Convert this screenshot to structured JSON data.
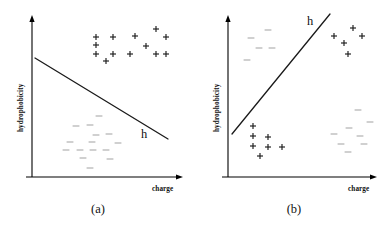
{
  "figure": {
    "width": 392,
    "height": 232,
    "background": "#ffffff",
    "marker_colors": {
      "positive": "#1c1c1c",
      "negative": "#b9b9b9",
      "axis": "#000000",
      "hypothesis_line": "#1a1a1a"
    }
  },
  "chart_data": {
    "type": "scatter",
    "title": "",
    "panels": [
      {
        "id": "a",
        "caption": "(a)",
        "xlabel": "charge",
        "ylabel": "hydrophobicity",
        "xlabel_pos": {
          "x": 152,
          "y": 186
        },
        "ylabel_pos": {
          "x": 18,
          "y": 132
        },
        "axes": {
          "origin": {
            "x": 32,
            "y": 177
          },
          "x_end": {
            "x": 183,
            "y": 177
          },
          "y_end": {
            "x": 32,
            "y": 15
          },
          "grid": false
        },
        "hypothesis": {
          "label": "h",
          "label_pos": {
            "x": 141,
            "y": 128
          },
          "x1": 35,
          "y1": 58,
          "x2": 168,
          "y2": 139
        },
        "legend": "",
        "series": [
          {
            "name": "positive",
            "symbol": "+",
            "points": [
              {
                "x": 96,
                "y": 37
              },
              {
                "x": 113,
                "y": 37
              },
              {
                "x": 135,
                "y": 36
              },
              {
                "x": 156,
                "y": 29
              },
              {
                "x": 166,
                "y": 37
              },
              {
                "x": 96,
                "y": 45
              },
              {
                "x": 146,
                "y": 46
              },
              {
                "x": 96,
                "y": 54
              },
              {
                "x": 113,
                "y": 54
              },
              {
                "x": 130,
                "y": 54
              },
              {
                "x": 156,
                "y": 54
              },
              {
                "x": 166,
                "y": 54
              },
              {
                "x": 106,
                "y": 61
              }
            ]
          },
          {
            "name": "negative",
            "symbol": "-",
            "points": [
              {
                "x": 99,
                "y": 116
              },
              {
                "x": 76,
                "y": 126
              },
              {
                "x": 90,
                "y": 125
              },
              {
                "x": 96,
                "y": 135
              },
              {
                "x": 109,
                "y": 134
              },
              {
                "x": 70,
                "y": 142
              },
              {
                "x": 92,
                "y": 142
              },
              {
                "x": 118,
                "y": 143
              },
              {
                "x": 66,
                "y": 150
              },
              {
                "x": 80,
                "y": 150
              },
              {
                "x": 93,
                "y": 150
              },
              {
                "x": 106,
                "y": 150
              },
              {
                "x": 83,
                "y": 158
              },
              {
                "x": 110,
                "y": 159
              },
              {
                "x": 90,
                "y": 168
              }
            ]
          }
        ]
      },
      {
        "id": "b",
        "caption": "(b)",
        "xlabel": "charge",
        "ylabel": "hydrophobicity",
        "xlabel_pos": {
          "x": 348,
          "y": 186
        },
        "ylabel_pos": {
          "x": 214,
          "y": 132
        },
        "axes": {
          "origin": {
            "x": 228,
            "y": 177
          },
          "x_end": {
            "x": 377,
            "y": 177
          },
          "y_end": {
            "x": 228,
            "y": 15
          },
          "grid": false
        },
        "hypothesis": {
          "label": "h",
          "label_pos": {
            "x": 307,
            "y": 15
          },
          "x1": 232,
          "y1": 134,
          "x2": 330,
          "y2": 14
        },
        "legend": "",
        "series": [
          {
            "name": "negative",
            "symbol": "-",
            "points": [
              {
                "x": 268,
                "y": 30
              },
              {
                "x": 251,
                "y": 38
              },
              {
                "x": 259,
                "y": 48
              },
              {
                "x": 272,
                "y": 48
              },
              {
                "x": 247,
                "y": 60
              },
              {
                "x": 358,
                "y": 110
              },
              {
                "x": 370,
                "y": 122
              },
              {
                "x": 349,
                "y": 128
              },
              {
                "x": 334,
                "y": 134
              },
              {
                "x": 360,
                "y": 136
              },
              {
                "x": 341,
                "y": 144
              },
              {
                "x": 364,
                "y": 144
              },
              {
                "x": 348,
                "y": 152
              }
            ]
          },
          {
            "name": "positive",
            "symbol": "+",
            "points": [
              {
                "x": 353,
                "y": 28
              },
              {
                "x": 334,
                "y": 36
              },
              {
                "x": 362,
                "y": 36
              },
              {
                "x": 344,
                "y": 43
              },
              {
                "x": 348,
                "y": 54
              },
              {
                "x": 253,
                "y": 126
              },
              {
                "x": 253,
                "y": 136
              },
              {
                "x": 268,
                "y": 137
              },
              {
                "x": 253,
                "y": 146
              },
              {
                "x": 268,
                "y": 147
              },
              {
                "x": 282,
                "y": 147
              },
              {
                "x": 260,
                "y": 156
              }
            ]
          }
        ]
      }
    ]
  }
}
